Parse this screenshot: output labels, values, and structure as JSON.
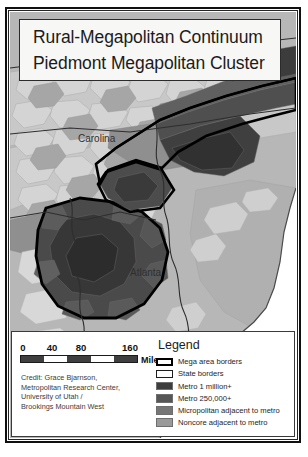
{
  "figure": {
    "kind": "thematic-choropleth-map"
  },
  "title": {
    "line1": "Rural-Megapolitan Continuum",
    "line2": "Piedmont Megapolitan Cluster"
  },
  "map": {
    "place_labels": [
      {
        "name": "Carolina",
        "x": 78,
        "y": 133
      },
      {
        "name": "Atlanta",
        "x": 130,
        "y": 267
      }
    ],
    "ocean_color": "#ffffff",
    "background_color": "#b4b4b4"
  },
  "scalebar": {
    "ticks": [
      "0",
      "40",
      "80",
      "160"
    ],
    "unit": "Miles",
    "segments": [
      "#3f3f3f",
      "#ffffff",
      "#3f3f3f",
      "#ffffff",
      "#3f3f3f"
    ]
  },
  "credit": {
    "lines": [
      "Credit: Grace Bjarnson,",
      "Metropolitan Research Center,",
      "University of Utah /",
      "Brookings Mountain West"
    ]
  },
  "legend": {
    "title": "Legend",
    "items": [
      {
        "label": "Mega area borders",
        "swatch": "outline-heavy",
        "color": "#000000"
      },
      {
        "label": "State borders",
        "swatch": "outline-thin",
        "color": "#1d1d1d"
      },
      {
        "label": "Metro 1 million+",
        "swatch": "fill",
        "color": "#3d3d3d"
      },
      {
        "label": "Metro 250,000+",
        "swatch": "fill",
        "color": "#565656"
      },
      {
        "label": "Micropolitan adjacent to metro",
        "swatch": "fill",
        "color": "#767676"
      },
      {
        "label": "Noncore adjacent to metro",
        "swatch": "fill",
        "color": "#9a9a9a"
      }
    ]
  }
}
